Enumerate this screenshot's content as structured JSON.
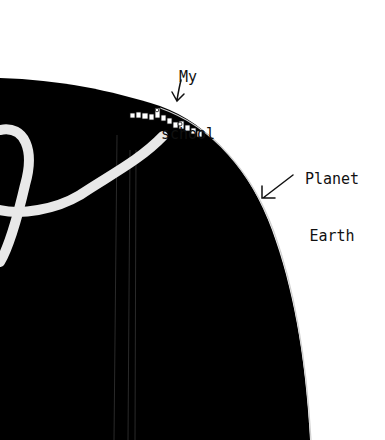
{
  "labels": {
    "school_line1": "My",
    "school_line2": "school",
    "earth_line1": "Planet",
    "earth_line2": "Earth"
  },
  "colors": {
    "background": "#ffffff",
    "planet": "#000000",
    "river": "#e8e8e8",
    "ink": "#111111"
  }
}
